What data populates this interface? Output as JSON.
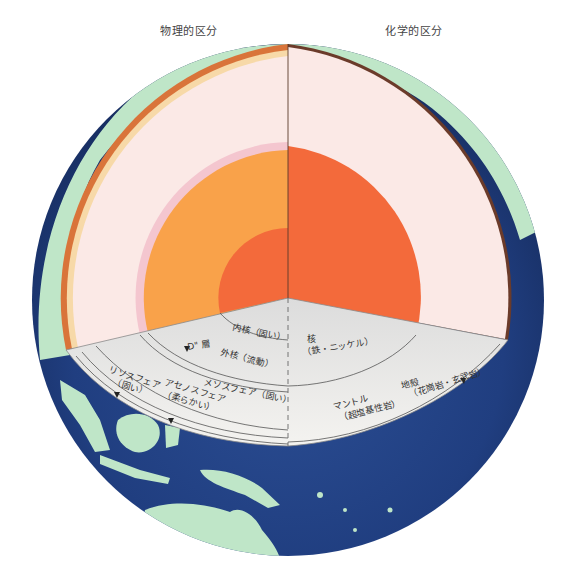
{
  "headers": {
    "physical": "物理的区分",
    "chemical": "化学的区分"
  },
  "labels": {
    "inner_core": "内核（固い）",
    "outer_core": "外核（流動）",
    "d_layer": "D\" 層",
    "core_chem_1": "核",
    "core_chem_2": "（鉄・ニッケル）",
    "lithosphere_1": "リソスフェア",
    "lithosphere_2": "（固い）",
    "asthenosphere_1": "アセノスフェア",
    "asthenosphere_2": "（柔らかい）",
    "mesosphere": "メソスフェア（固い）",
    "mantle_1": "マントル",
    "mantle_2": "（超塩基性岩）",
    "crust_1": "地殻",
    "crust_2": "（花崗岩・玄武岩）"
  },
  "colors": {
    "ocean": "#1f3a78",
    "land": "#bfe6c8",
    "mantle": "#fbe9e6",
    "outer_core_phys": "#f9a24a",
    "core_chem": "#f36a3b",
    "inner_core": "#f36a3b",
    "d_layer": "#f4c6cf",
    "floor": "#ecebe8",
    "crust": "#d9743a"
  }
}
